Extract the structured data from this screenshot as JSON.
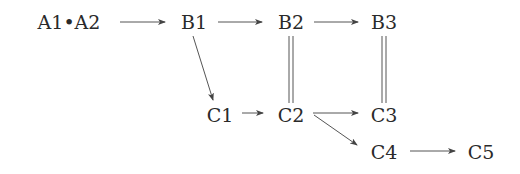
{
  "diagram": {
    "type": "commutative-diagram",
    "nodes": [
      {
        "id": "A",
        "label": "A1•A2",
        "x": 69,
        "y": 22
      },
      {
        "id": "B1",
        "label": "B1",
        "x": 194,
        "y": 22
      },
      {
        "id": "B2",
        "label": "B2",
        "x": 291,
        "y": 22
      },
      {
        "id": "B3",
        "label": "B3",
        "x": 384,
        "y": 22
      },
      {
        "id": "C1",
        "label": "C1",
        "x": 220,
        "y": 115
      },
      {
        "id": "C2",
        "label": "C2",
        "x": 291,
        "y": 115
      },
      {
        "id": "C3",
        "label": "C3",
        "x": 384,
        "y": 115
      },
      {
        "id": "C4",
        "label": "C4",
        "x": 384,
        "y": 152
      },
      {
        "id": "C5",
        "label": "C5",
        "x": 481,
        "y": 152
      }
    ],
    "edges": [
      {
        "from": "A",
        "to": "B1",
        "style": "arrow"
      },
      {
        "from": "B1",
        "to": "B2",
        "style": "arrow"
      },
      {
        "from": "B2",
        "to": "B3",
        "style": "arrow"
      },
      {
        "from": "B1",
        "to": "C1",
        "style": "arrow"
      },
      {
        "from": "B2",
        "to": "C2",
        "style": "double-line"
      },
      {
        "from": "B3",
        "to": "C3",
        "style": "double-line"
      },
      {
        "from": "C1",
        "to": "C2",
        "style": "arrow"
      },
      {
        "from": "C2",
        "to": "C3",
        "style": "arrow"
      },
      {
        "from": "C2",
        "to": "C4",
        "style": "arrow"
      },
      {
        "from": "C4",
        "to": "C5",
        "style": "arrow"
      }
    ]
  }
}
